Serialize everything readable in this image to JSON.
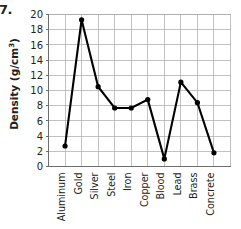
{
  "item_number": "7.",
  "chart_data": {
    "type": "line",
    "title": "",
    "xlabel": "",
    "ylabel": "Density (g/cm3)",
    "ylabel_base": "Density (g/cm",
    "ylabel_sup": "3",
    "ylabel_close": ")",
    "categories": [
      "Aluminum",
      "Gold",
      "Silver",
      "Steel",
      "Iron",
      "Copper",
      "Blood",
      "Lead",
      "Brass",
      "Concrete"
    ],
    "values": [
      2.7,
      19.3,
      10.5,
      7.7,
      7.7,
      8.8,
      1.0,
      11.1,
      8.4,
      1.8
    ],
    "series": [
      {
        "name": "Density",
        "values": [
          2.7,
          19.3,
          10.5,
          7.7,
          7.7,
          8.8,
          1.0,
          11.1,
          8.4,
          1.8
        ]
      }
    ],
    "ylim": [
      0,
      20
    ],
    "ytick_step": 2,
    "ytick_labels": [
      "20",
      "18",
      "16",
      "14",
      "12",
      "10",
      "8",
      "6",
      "4",
      "2",
      "0"
    ],
    "ytick_values": [
      20,
      18,
      16,
      14,
      12,
      10,
      8,
      6,
      4,
      2,
      0
    ],
    "grid": true,
    "grid_axis": "both",
    "legend": "none",
    "marker": "filled-circle",
    "line_color": "#000000",
    "grid_color": "#a8a8a8",
    "axis_color": "#6d6d6d",
    "background_color": "#ffffff"
  }
}
